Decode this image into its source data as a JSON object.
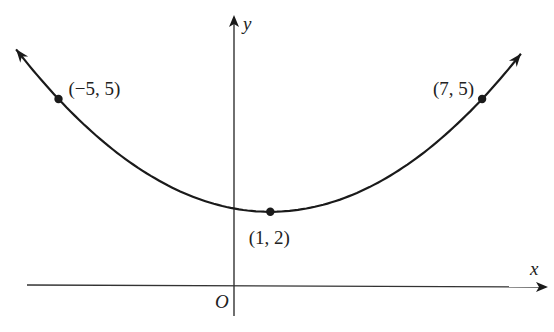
{
  "chart_data": {
    "type": "line",
    "title": "",
    "function": "y = (1/12)(x - 1)^2 + 2",
    "xlabel": "x",
    "ylabel": "y",
    "origin_label": "O",
    "xlim": [
      -6.2,
      8.1
    ],
    "ylim": [
      0,
      6.3
    ],
    "grid": false,
    "series": [
      {
        "name": "parabola",
        "vertex": [
          1,
          2
        ],
        "a": 0.08333,
        "x_range": [
          -6.2,
          8.1
        ]
      }
    ],
    "points": [
      {
        "x": -5,
        "y": 5,
        "label": "(−5, 5)",
        "position": "right"
      },
      {
        "x": 7,
        "y": 5,
        "label": "(7, 5)",
        "position": "left"
      },
      {
        "x": 1,
        "y": 2,
        "label": "(1, 2)",
        "position": "below"
      }
    ]
  },
  "colors": {
    "ink": "#1a1a1a",
    "background": "#ffffff"
  }
}
